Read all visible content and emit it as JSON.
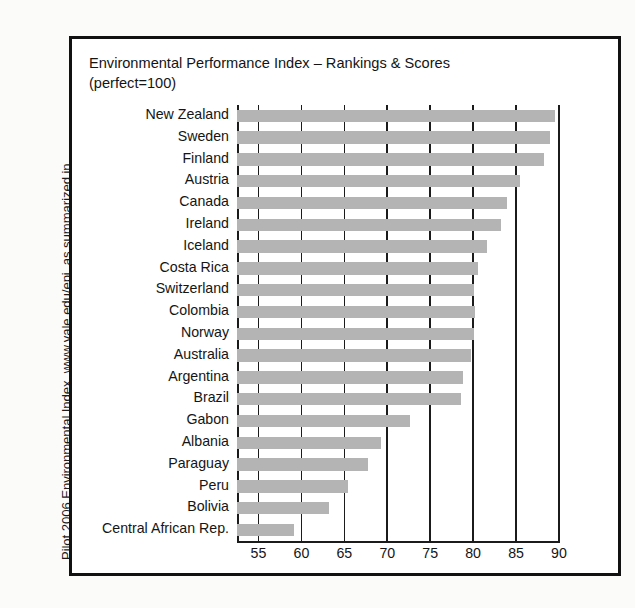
{
  "caption": {
    "line1": "Pilot 2006 Environmental Index, www.yale.edu/epi, as summarized in",
    "line2_italic": "Resources for the Future,",
    "line2_rest": " Spring 2006, No. 161, page 6."
  },
  "chart_data": {
    "type": "bar",
    "orientation": "horizontal",
    "title": "Environmental Performance Index – Rankings & Scores\n(perfect=100)",
    "xlabel": "",
    "ylabel": "",
    "xlim": [
      52.5,
      90
    ],
    "axis_start": 52.5,
    "grid": true,
    "grid_axis": "x",
    "legend": null,
    "bar_color": "#b4b4b4",
    "axis_color": "#1b1b1b",
    "xticks": [
      55,
      60,
      65,
      70,
      75,
      80,
      85,
      90
    ],
    "categories": [
      "New Zealand",
      "Sweden",
      "Finland",
      "Austria",
      "Canada",
      "Ireland",
      "Iceland",
      "Costa Rica",
      "Switzerland",
      "Colombia",
      "Norway",
      "Australia",
      "Argentina",
      "Brazil",
      "Gabon",
      "Albania",
      "Paraguay",
      "Peru",
      "Bolivia",
      "Central African Rep."
    ],
    "values": [
      89.5,
      88.9,
      88.2,
      85.5,
      84.0,
      83.3,
      81.6,
      80.6,
      80.1,
      80.2,
      80.1,
      79.8,
      78.8,
      78.6,
      72.6,
      69.3,
      67.8,
      65.4,
      63.2,
      59.1
    ]
  }
}
